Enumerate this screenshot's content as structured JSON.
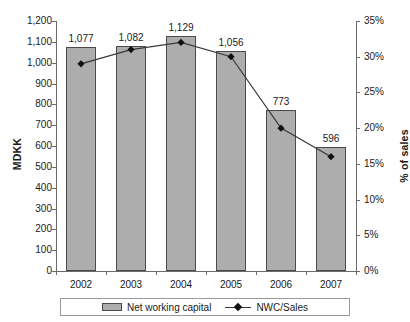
{
  "chart_data": {
    "type": "bar",
    "title": "Net working capital",
    "subtitle": "",
    "categories": [
      "2002",
      "2003",
      "2004",
      "2005",
      "2006",
      "2007"
    ],
    "series": [
      {
        "name": "Net working capital",
        "type": "bar",
        "axis": "left",
        "unit": "MDKK",
        "values": [
          1077,
          1082,
          1129,
          1056,
          773,
          596
        ],
        "labels": [
          "1,077",
          "1,082",
          "1,129",
          "1,056",
          "773",
          "596"
        ],
        "color": "#adadad"
      },
      {
        "name": "NWC/Sales",
        "type": "line",
        "axis": "right",
        "unit": "%",
        "values": [
          29,
          31,
          32,
          30,
          20,
          16
        ],
        "color": "#3a3a3a",
        "marker": "diamond"
      }
    ],
    "xlabel": "",
    "ylabel": "MDKK",
    "y2label": "% of sales",
    "ylim": [
      0,
      1200
    ],
    "y2lim": [
      0,
      35
    ],
    "yticks": [
      "0",
      "100",
      "200",
      "300",
      "400",
      "500",
      "600",
      "700",
      "800",
      "900",
      "1,000",
      "1,100",
      "1,200"
    ],
    "y2ticks": [
      "0%",
      "5%",
      "10%",
      "15%",
      "20%",
      "25%",
      "30%",
      "35%"
    ],
    "grid": false,
    "legend_position": "bottom",
    "legend": [
      "Net working capital",
      "NWC/Sales"
    ]
  },
  "axes": {
    "left_title": "MDKK",
    "right_title": "% of sales"
  },
  "legend": {
    "bar_label": "Net working capital",
    "line_label": "NWC/Sales"
  }
}
